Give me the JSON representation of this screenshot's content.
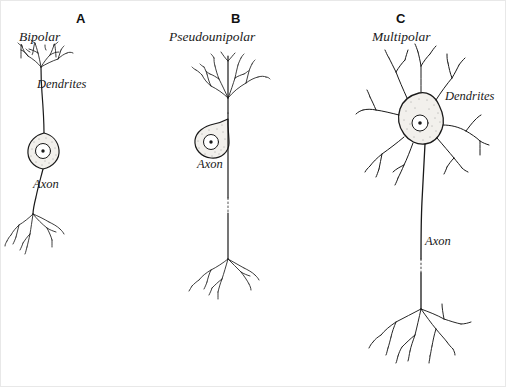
{
  "figure": {
    "background_color": "#ffffff",
    "ink_color": "#1a1a1a",
    "border_color": "#e8e8e8",
    "width": 506,
    "height": 387
  },
  "panels": [
    {
      "letter": "A",
      "type": "Bipolar",
      "letter_x": 80,
      "letter_y": 10,
      "type_x": 18,
      "type_y": 28,
      "labels": [
        {
          "text": "Dendrites",
          "x": 36,
          "y": 83,
          "name": "dendrites-label"
        },
        {
          "text": "Axon",
          "x": 32,
          "y": 183,
          "name": "axon-label"
        }
      ],
      "soma_shape": "spindle",
      "soma_cx": 43,
      "soma_cy": 149,
      "has_axon_break": false
    },
    {
      "letter": "B",
      "type": "Pseudounipolar",
      "letter_x": 215,
      "letter_y": 10,
      "type_x": 168,
      "type_y": 28,
      "labels": [
        {
          "text": "Axon",
          "x": 196,
          "y": 163,
          "name": "axon-label"
        }
      ],
      "soma_shape": "round-stalked",
      "soma_cx": 213,
      "soma_cy": 130,
      "has_axon_break": true
    },
    {
      "letter": "C",
      "type": "Multipolar",
      "letter_x": 400,
      "letter_y": 10,
      "type_x": 389,
      "type_y": 28,
      "labels": [
        {
          "text": "Dendrites",
          "x": 444,
          "y": 95,
          "name": "dendrites-label"
        },
        {
          "text": "Axon",
          "x": 424,
          "y": 240,
          "name": "axon-label"
        }
      ],
      "soma_shape": "polygonal",
      "soma_cx": 418,
      "soma_cy": 120,
      "has_axon_break": true
    }
  ],
  "diagram_parts": {
    "dendrite_name": "Dendrites",
    "axon_name": "Axon",
    "nucleus_name": "nucleus",
    "soma_name": "cell-body"
  }
}
